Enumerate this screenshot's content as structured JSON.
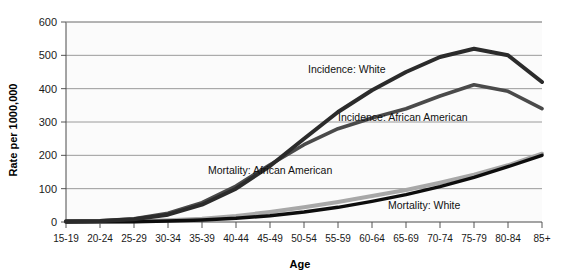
{
  "chart_data": {
    "type": "line",
    "title": "",
    "xlabel": "Age",
    "ylabel": "Rate per 1000,000",
    "ylim": [
      0,
      600
    ],
    "yticks": [
      0,
      100,
      200,
      300,
      400,
      500,
      600
    ],
    "grid": true,
    "legend_position": "inline-labels",
    "categories": [
      "15-19",
      "20-24",
      "25-29",
      "30-34",
      "35-39",
      "40-44",
      "45-49",
      "50-54",
      "55-59",
      "60-64",
      "65-69",
      "70-74",
      "75-79",
      "80-84",
      "85+"
    ],
    "series": [
      {
        "name": "Incidence: White",
        "color": "#2b2b2b",
        "width": 4.0,
        "values": [
          2,
          3,
          8,
          22,
          52,
          100,
          168,
          250,
          330,
          395,
          450,
          495,
          520,
          500,
          420
        ]
      },
      {
        "name": "Incidence: African American",
        "color": "#4a4a4a",
        "width": 3.6,
        "values": [
          2,
          4,
          10,
          26,
          58,
          108,
          172,
          232,
          280,
          312,
          340,
          378,
          412,
          392,
          340
        ]
      },
      {
        "name": "Mortality: African American",
        "color": "#a8a8a8",
        "width": 4.0,
        "values": [
          1,
          1,
          2,
          5,
          10,
          18,
          30,
          44,
          60,
          78,
          96,
          118,
          142,
          170,
          205
        ]
      },
      {
        "name": "Mortality: White",
        "color": "#0d0d0d",
        "width": 3.4,
        "values": [
          0,
          1,
          1,
          3,
          6,
          11,
          19,
          30,
          44,
          62,
          82,
          106,
          134,
          166,
          200
        ]
      }
    ],
    "annotations": [
      {
        "text": "Incidence: White",
        "x_px": 308,
        "y_px": 73
      },
      {
        "text": "Incidence: African American",
        "x_px": 338,
        "y_px": 121
      },
      {
        "text": "Mortality: African American",
        "x_px": 208,
        "y_px": 174
      },
      {
        "text": "Mortality: White",
        "x_px": 388,
        "y_px": 209
      }
    ]
  }
}
